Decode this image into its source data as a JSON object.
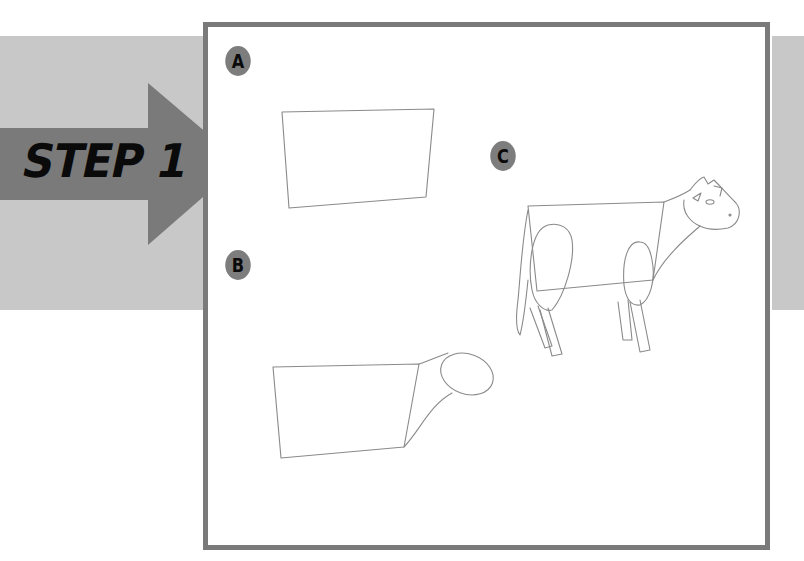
{
  "header": {
    "step_label": "STEP 1"
  },
  "panels": [
    {
      "label": "A",
      "description": "Tilted rectangle body outline"
    },
    {
      "label": "B",
      "description": "Rectangle body with neck and oval head"
    },
    {
      "label": "C",
      "description": "Cow sketch with legs, tail, ears and face"
    }
  ],
  "colors": {
    "band": "#c8c8c8",
    "arrow": "#7a7a7a",
    "frame_border": "#7a7a7a",
    "badge": "#7d7d7d",
    "text": "#0a0a0a",
    "sketch_line": "#8a8a8a"
  }
}
